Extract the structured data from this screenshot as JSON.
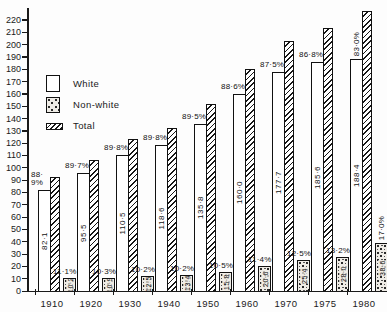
{
  "legend": {
    "white": "White",
    "nonwhite": "Non-white",
    "total": "Total"
  },
  "chart_data": {
    "type": "bar",
    "title": "",
    "xlabel": "",
    "ylabel": "",
    "ylim": [
      0,
      220
    ],
    "ytick_step": 10,
    "grid": false,
    "legend_position": "upper-left",
    "decimal_separator": "·",
    "categories": [
      "1910",
      "1920",
      "1930",
      "1940",
      "1950",
      "1960",
      "1970",
      "1975",
      "1980"
    ],
    "series": [
      {
        "name": "White",
        "values": [
          82.1,
          95.5,
          110.5,
          118.6,
          135.8,
          160.0,
          177.7,
          185.6,
          188.4
        ],
        "value_labels": [
          "82·1",
          "95·5",
          "110·5",
          "118·6",
          "135·8",
          "160·0",
          "177·7",
          "185·6",
          "188·4"
        ],
        "pct_labels": [
          "88·9%",
          "89·7%",
          "89·8%",
          "89·8%",
          "89·5%",
          "88·6%",
          "87·5%",
          "86·8%",
          "83·0%"
        ],
        "pct_orientation": [
          "wrap",
          "h",
          "h",
          "h",
          "h",
          "h",
          "h",
          "h",
          "v"
        ]
      },
      {
        "name": "Non-white",
        "values": [
          10.2,
          10.9,
          12.5,
          13.4,
          15.8,
          20.6,
          25.4,
          28.0,
          38.6
        ],
        "value_labels": [
          "10·2",
          "10·9",
          "12·5",
          "13·4",
          "15·8",
          "20·6",
          "25·4",
          "28·0",
          "38·6"
        ],
        "pct_labels": [
          "11·1%",
          "10·3%",
          "10·2%",
          "10·2%",
          "10·5%",
          "11·4%",
          "12·5%",
          "13·2%",
          "17·0%"
        ],
        "pct_orientation": [
          "h",
          "h",
          "h",
          "h",
          "h",
          "h",
          "h",
          "h",
          "v"
        ]
      },
      {
        "name": "Total",
        "values": [
          92.3,
          106.4,
          123.0,
          132.0,
          151.6,
          180.6,
          203.1,
          213.6,
          227.0
        ],
        "value_labels": [],
        "pct_labels": []
      }
    ]
  }
}
